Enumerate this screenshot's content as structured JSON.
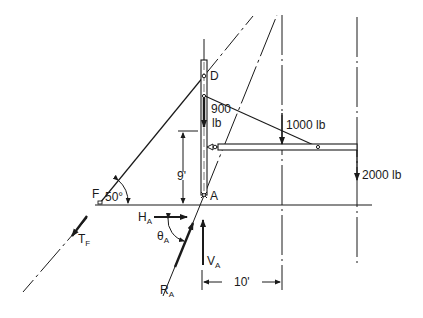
{
  "diagram": {
    "type": "free-body diagram",
    "colors": {
      "ink": "#1a1a1a",
      "background": "#ffffff"
    },
    "points": {
      "D": {
        "label": "D"
      },
      "A": {
        "label": "A"
      },
      "F": {
        "label": "F"
      }
    },
    "loads": {
      "post_load": {
        "value": "900",
        "unit": "lb"
      },
      "mid_load": {
        "label": "1000 lb"
      },
      "end_load": {
        "label": "2000 lb"
      }
    },
    "angles": {
      "cable_angle": {
        "label": "50°"
      },
      "theta": {
        "symbol": "θ",
        "subscript": "A"
      }
    },
    "dimensions": {
      "height": {
        "label": "9'"
      },
      "span": {
        "label": "10'"
      }
    },
    "forces": {
      "HA": {
        "symbol": "H",
        "subscript": "A"
      },
      "VA": {
        "symbol": "V",
        "subscript": "A"
      },
      "RA": {
        "symbol": "R",
        "subscript": "A"
      },
      "TF": {
        "symbol": "T",
        "subscript": "F"
      }
    }
  }
}
